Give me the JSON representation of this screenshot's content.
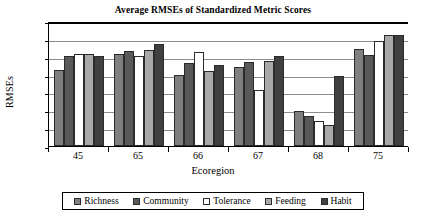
{
  "chart_data": {
    "type": "bar",
    "title": "Average RMSEs of Standardized Metric Scores",
    "xlabel": "Ecoregion",
    "ylabel": "RMSEs",
    "ylim": [
      0,
      35
    ],
    "yticks": [
      0,
      5,
      10,
      15,
      20,
      25,
      30,
      35
    ],
    "grid": true,
    "legend_position": "bottom",
    "categories": [
      "45",
      "65",
      "66",
      "67",
      "68",
      "75"
    ],
    "series": [
      {
        "name": "Richness",
        "color": "#7f7f7f",
        "values": [
          21.3,
          25.9,
          20.0,
          22.2,
          9.8,
          27.1
        ]
      },
      {
        "name": "Community",
        "color": "#595959",
        "values": [
          25.2,
          26.7,
          23.3,
          23.5,
          8.4,
          25.5
        ]
      },
      {
        "name": "Tolerance",
        "color": "#ffffff",
        "values": [
          25.9,
          25.3,
          26.4,
          15.7,
          7.0,
          29.5
        ]
      },
      {
        "name": "Feeding",
        "color": "#a9a9a9",
        "values": [
          25.9,
          26.8,
          21.0,
          23.8,
          5.9,
          31.1
        ]
      },
      {
        "name": "Habit",
        "color": "#404040",
        "values": [
          25.2,
          28.6,
          22.7,
          25.3,
          19.7,
          31.0
        ]
      }
    ]
  },
  "legend": {
    "items": [
      {
        "label": "Richness"
      },
      {
        "label": "Community"
      },
      {
        "label": "Tolerance"
      },
      {
        "label": "Feeding"
      },
      {
        "label": "Habit"
      }
    ]
  }
}
